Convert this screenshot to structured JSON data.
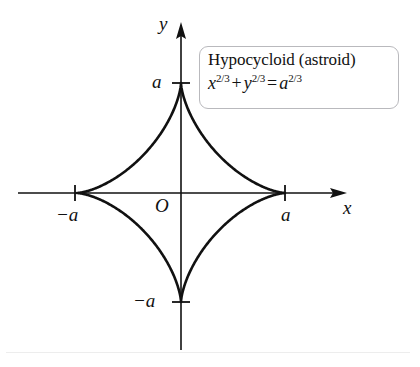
{
  "figure": {
    "kind": "math-plot",
    "background_color": "#ffffff",
    "ink_color": "#111111",
    "axes": {
      "x_axis_label": "x",
      "y_axis_label": "y",
      "origin_label": "O",
      "origin_px": [
        181,
        193
      ],
      "x_axis_span_px": [
        18,
        347
      ],
      "y_axis_span_px": [
        22,
        350
      ],
      "arrowheads": [
        "x-positive",
        "y-positive"
      ]
    },
    "ticks": [
      {
        "name": "x-negative-a",
        "label": "−a",
        "value": "-a",
        "px": [
          75,
          193
        ]
      },
      {
        "name": "x-positive-a",
        "label": "a",
        "value": "a",
        "px": [
          285,
          193
        ]
      },
      {
        "name": "y-positive-a",
        "label": "a",
        "value": "a",
        "px": [
          181,
          83
        ]
      },
      {
        "name": "y-negative-a",
        "label": "−a",
        "value": "-a",
        "px": [
          181,
          302
        ]
      }
    ],
    "callout": {
      "title": "Hypocycloid (astroid)",
      "equation": {
        "term_x_base": "x",
        "term_x_exp": "2/3",
        "operator": "+",
        "term_y_base": "y",
        "term_y_exp": "2/3",
        "equals": "=",
        "term_a_base": "a",
        "term_a_exp": "2/3",
        "plain": "x^(2/3) + y^(2/3) = a^(2/3)"
      },
      "border_color": "#b9b9bd"
    }
  },
  "chart_data": {
    "type": "line",
    "title": "Hypocycloid (astroid)",
    "subtitle": "x^(2/3) + y^(2/3) = a^(2/3)",
    "xlabel": "x",
    "ylabel": "y",
    "grid": false,
    "legend": null,
    "xlim": [
      -1.55,
      1.6
    ],
    "ylim": [
      -1.55,
      1.25
    ],
    "xticks": [
      -1,
      1
    ],
    "xticklabels": [
      "−a",
      "a"
    ],
    "yticks": [
      -1,
      1
    ],
    "yticklabels": [
      "−a",
      "a"
    ],
    "annotations": [
      "O"
    ],
    "curve": {
      "name": "astroid",
      "parametric": "x = a*cos(t)^3, y = a*sin(t)^3",
      "a": 1,
      "cusps": [
        [
          1,
          0
        ],
        [
          0,
          1
        ],
        [
          -1,
          0
        ],
        [
          0,
          -1
        ]
      ],
      "closed": true,
      "stroke_width_px": 2.6
    }
  }
}
